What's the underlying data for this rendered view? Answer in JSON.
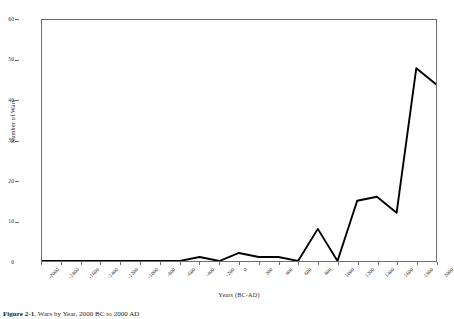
{
  "figure": {
    "caption_label": "Figure 2-1.",
    "caption_text": "Wars by Year, 2000 BC to 2000 AD"
  },
  "chart_data": {
    "type": "line",
    "title": "",
    "xlabel": "Years (BC-AD)",
    "ylabel": "Number of Wars",
    "xlim": [
      -2000,
      2000
    ],
    "ylim": [
      0,
      60
    ],
    "grid": false,
    "legend": "none",
    "line_color": "#000000",
    "line_width": 1.8,
    "x_tick_labels": [
      "-2000",
      "-1800",
      "-1600",
      "-1400",
      "-1200",
      "-1000",
      "-800",
      "-600",
      "-400",
      "-200",
      "0",
      "200",
      "400",
      "600",
      "800",
      "1000",
      "1200",
      "1400",
      "1600",
      "1800",
      "2000"
    ],
    "y_tick_labels": [
      "0",
      "10",
      "20",
      "30",
      "40",
      "50",
      "60"
    ],
    "y_ticks": [
      0,
      10,
      20,
      30,
      40,
      50,
      60
    ],
    "x": [
      -2000,
      -1800,
      -1600,
      -1400,
      -1200,
      -1000,
      -800,
      -600,
      -400,
      -200,
      0,
      200,
      400,
      600,
      800,
      1000,
      1200,
      1400,
      1600,
      1800,
      2000
    ],
    "values": [
      0,
      0,
      0,
      0,
      0,
      0,
      0,
      0,
      1,
      0,
      2,
      1,
      1,
      0,
      8,
      0,
      15,
      16,
      12,
      48,
      44
    ],
    "series": [
      {
        "name": "Number of Wars",
        "values": [
          0,
          0,
          0,
          0,
          0,
          0,
          0,
          0,
          1,
          0,
          2,
          1,
          1,
          0,
          8,
          0,
          15,
          16,
          12,
          48,
          44
        ]
      }
    ],
    "annotations": []
  }
}
